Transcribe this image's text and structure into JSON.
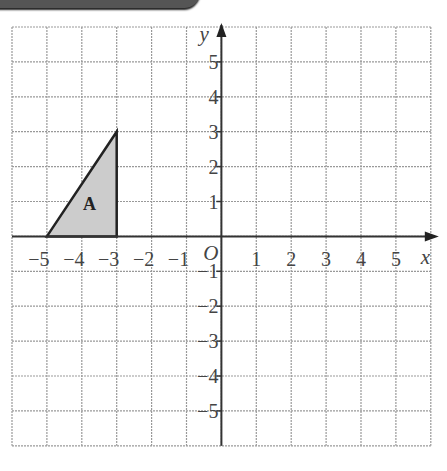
{
  "chart_data": {
    "type": "scatter",
    "title": "",
    "xlabel": "x",
    "ylabel": "y",
    "origin_label": "O",
    "xlim": [
      -6,
      6
    ],
    "ylim": [
      -6,
      6
    ],
    "grid": true,
    "x_ticks": [
      "-5",
      "-4",
      "-3",
      "-2",
      "-1",
      "1",
      "2",
      "3",
      "4",
      "5"
    ],
    "y_ticks": [
      "5",
      "4",
      "3",
      "2",
      "1",
      "-1",
      "-2",
      "-3",
      "-4",
      "-5"
    ],
    "shapes": [
      {
        "label": "A",
        "points": [
          [
            -5,
            0
          ],
          [
            -3,
            3
          ],
          [
            -3,
            0
          ]
        ],
        "fill": "#cccccc"
      }
    ]
  }
}
